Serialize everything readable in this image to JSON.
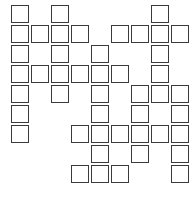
{
  "canvas": {
    "width": 195,
    "height": 201,
    "background_color": "#ffffff",
    "cell_border_color": "#3a3a3a",
    "cell_fill_color": "#ffffff",
    "cell_size": 18,
    "cell_pitch_x": 20,
    "cell_pitch_y": 20,
    "origin_x": 11,
    "origin_y": 5,
    "columns": 9,
    "rows": 10
  },
  "grid": {
    "description": "Crossword-style grid of empty white squares with dark outlines",
    "filled_cells": [
      [
        0,
        0
      ],
      [
        0,
        2
      ],
      [
        0,
        7
      ],
      [
        1,
        0
      ],
      [
        1,
        1
      ],
      [
        1,
        2
      ],
      [
        1,
        3
      ],
      [
        1,
        5
      ],
      [
        1,
        6
      ],
      [
        1,
        7
      ],
      [
        1,
        8
      ],
      [
        2,
        0
      ],
      [
        2,
        2
      ],
      [
        2,
        4
      ],
      [
        2,
        7
      ],
      [
        3,
        0
      ],
      [
        3,
        1
      ],
      [
        3,
        2
      ],
      [
        3,
        3
      ],
      [
        3,
        4
      ],
      [
        3,
        5
      ],
      [
        3,
        7
      ],
      [
        4,
        0
      ],
      [
        4,
        2
      ],
      [
        4,
        4
      ],
      [
        4,
        6
      ],
      [
        4,
        7
      ],
      [
        4,
        8
      ],
      [
        5,
        0
      ],
      [
        5,
        4
      ],
      [
        5,
        6
      ],
      [
        5,
        8
      ],
      [
        6,
        0
      ],
      [
        6,
        3
      ],
      [
        6,
        4
      ],
      [
        6,
        5
      ],
      [
        6,
        6
      ],
      [
        6,
        7
      ],
      [
        6,
        8
      ],
      [
        7,
        4
      ],
      [
        7,
        6
      ],
      [
        7,
        8
      ],
      [
        8,
        3
      ],
      [
        8,
        4
      ],
      [
        8,
        5
      ],
      [
        8,
        8
      ]
    ],
    "row_patterns": [
      "X.X....X.",
      "XXXX.XXXX",
      "X.X.X..X.",
      "XXXXXX.X.",
      "X.X.X.XXX",
      "X...X.X.X",
      "X..XXXXXX",
      "....X.X.X",
      "...XXX..X",
      "........."
    ]
  }
}
